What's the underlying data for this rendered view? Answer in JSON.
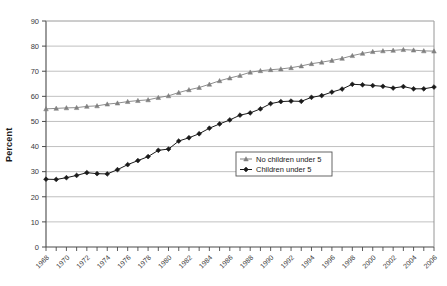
{
  "chart_data": {
    "type": "line",
    "title": "",
    "xlabel": "",
    "ylabel": "Percent",
    "ylim": [
      0,
      90
    ],
    "ytick_step": 10,
    "yticks": [
      0,
      10,
      20,
      30,
      40,
      50,
      60,
      70,
      80,
      90
    ],
    "ytick_labels": [
      "0",
      "10",
      "20",
      "30",
      "40",
      "50",
      "60",
      "70",
      "80",
      "90"
    ],
    "grid": true,
    "grid_axis": "y",
    "legend_position": "center-right",
    "x": [
      1968,
      1969,
      1970,
      1971,
      1972,
      1973,
      1974,
      1975,
      1976,
      1977,
      1978,
      1979,
      1980,
      1981,
      1982,
      1983,
      1984,
      1985,
      1986,
      1987,
      1988,
      1989,
      1990,
      1991,
      1992,
      1993,
      1994,
      1995,
      1996,
      1997,
      1998,
      1999,
      2000,
      2001,
      2002,
      2003,
      2004,
      2005,
      2006
    ],
    "xtick_labels": [
      "1968",
      "1970",
      "1972",
      "1974",
      "1976",
      "1978",
      "1980",
      "1982",
      "1984",
      "1986",
      "1988",
      "1990",
      "1992",
      "1994",
      "1996",
      "1998",
      "2000",
      "2002",
      "2004",
      "2006"
    ],
    "xtick_label_step": 2,
    "xtick_rotation": -45,
    "series": [
      {
        "name": "No children under 5",
        "color": "#808080",
        "marker": "triangle",
        "values": [
          55.0,
          55.2,
          55.4,
          55.5,
          56.0,
          56.2,
          56.9,
          57.3,
          57.9,
          58.3,
          58.6,
          59.5,
          60.2,
          61.5,
          62.6,
          63.5,
          64.8,
          66.2,
          67.3,
          68.3,
          69.6,
          70.2,
          70.6,
          70.9,
          71.4,
          72.1,
          73.0,
          73.6,
          74.3,
          75.1,
          76.2,
          77.1,
          77.8,
          78.1,
          78.3,
          78.6,
          78.4,
          78.1,
          78.0
        ]
      },
      {
        "name": "Children under 5",
        "color": "#1a1a1a",
        "marker": "diamond",
        "values": [
          27.0,
          26.9,
          27.6,
          28.5,
          29.6,
          29.2,
          29.1,
          30.8,
          32.8,
          34.4,
          36.0,
          38.5,
          39.0,
          42.2,
          43.5,
          45.1,
          47.3,
          49.0,
          50.6,
          52.5,
          53.4,
          55.0,
          57.1,
          57.9,
          58.1,
          58.0,
          59.6,
          60.3,
          61.7,
          62.9,
          64.8,
          64.6,
          64.3,
          64.0,
          63.3,
          63.9,
          63.0,
          63.0,
          63.7
        ]
      }
    ]
  },
  "legend": {
    "items": [
      {
        "label": "No children under 5"
      },
      {
        "label": "Children under 5"
      }
    ]
  },
  "axes": {
    "y_title": "Percent"
  }
}
